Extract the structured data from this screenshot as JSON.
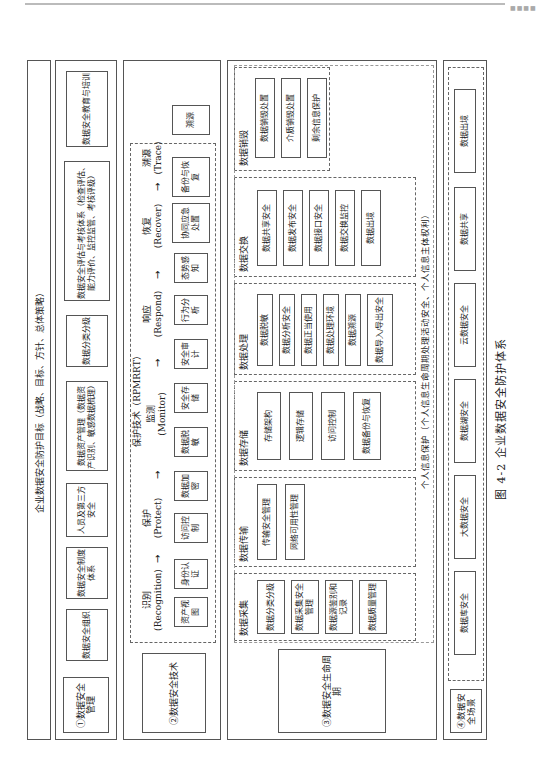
{
  "figure_caption": "图 4-2   企业数据安全防护体系",
  "header_banner": "企业数据安全防护目标（战略、目标、方针、总体策略）",
  "layers": {
    "management": {
      "label": "①数据安全管理",
      "items": [
        "数据安全组织",
        "数据安全制度体系",
        "人员及第三方安全",
        "数据资产管理（数据资产识别、敏感数据梳理）",
        "数据分类分级",
        "数据安全评估与考核体系（检查评估、能力评价、监控监管、考核评级）",
        "数据安全教育与培训"
      ]
    },
    "technology": {
      "label": "②数据安全技术",
      "title": "保护技术（RPMRRT）",
      "phases": [
        {
          "name": "识别",
          "en": "(Recognition)",
          "items": [
            "资产视图",
            "身份认证"
          ]
        },
        {
          "name": "保护",
          "en": "(Protect)",
          "items": [
            "访问控制",
            "数据加密"
          ]
        },
        {
          "name": "监测",
          "en": "(Monitor)",
          "items": [
            "数据脱敏",
            "安全存储",
            "安全审计"
          ]
        },
        {
          "name": "响应",
          "en": "(Respond)",
          "items": [
            "行为分析",
            "态势感知"
          ]
        },
        {
          "name": "恢复",
          "en": "(Recover)",
          "items": [
            "协同应急处置",
            "备份与恢复"
          ]
        },
        {
          "name": "溯源",
          "en": "(Trace)",
          "items": [
            "溯源"
          ]
        }
      ]
    },
    "lifecycle": {
      "label": "③数据安全生命周期",
      "stages": [
        {
          "name": "数据采集",
          "items": [
            "数据分类分级",
            "数据采集安全管理",
            "数据源鉴别和记录",
            "数据质量管理"
          ]
        },
        {
          "name": "数据传输",
          "items": [
            "传输安全管理",
            "网络可用性管理"
          ]
        },
        {
          "name": "数据存储",
          "items": [
            "存储架构",
            "逻辑存储",
            "访问控制",
            "数据备份与恢复"
          ]
        },
        {
          "name": "数据处理",
          "items": [
            "数据脱敏",
            "数据分析安全",
            "数据正当使用",
            "数据处理环境",
            "数据溯源",
            "数据导入/导出安全"
          ]
        },
        {
          "name": "数据交换",
          "items": [
            "数据共享安全",
            "数据发布安全",
            "数据接口安全",
            "数据交换监控",
            "数据出境"
          ]
        },
        {
          "name": "数据销毁",
          "items": [
            "数据销毁处置",
            "介质销毁处置",
            "剩余信息保护"
          ]
        }
      ],
      "footer": "个人信息保护（个人信息生命周期处理活动安全、个人信息主体权利）"
    },
    "scenario": {
      "label": "④数据安全场景",
      "items": [
        "数据库安全",
        "大数据安全",
        "数据湖安全",
        "云数据安全",
        "数据共享",
        "数据出境"
      ]
    }
  }
}
